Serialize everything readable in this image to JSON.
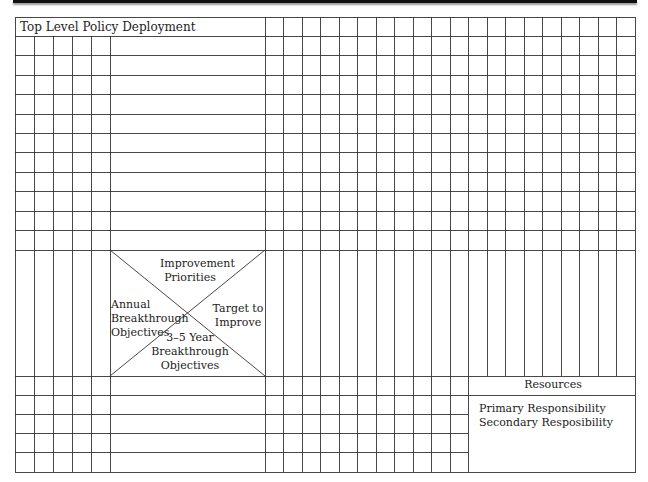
{
  "form": {
    "title": "Top Level Policy Deployment",
    "x_matrix": {
      "top": [
        "Improvement",
        "Priorities"
      ],
      "left": [
        "Annual",
        "Breakthrough",
        "Objectives"
      ],
      "right": [
        "Target to",
        "Improve"
      ],
      "bottom": [
        "3–5 Year",
        "Breakthrough",
        "Objectives"
      ]
    },
    "resources": {
      "header": "Resources",
      "legend": [
        "Primary Responsibility",
        "Secondary Resposibility"
      ]
    }
  },
  "colors": {
    "line": "#333333",
    "bar": "#111111",
    "background": "#ffffff"
  }
}
